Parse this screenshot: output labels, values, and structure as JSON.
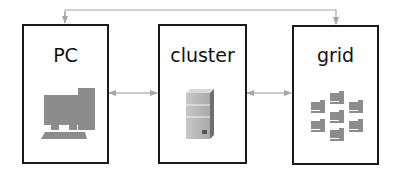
{
  "diagram": {
    "nodes": [
      {
        "id": "pc",
        "label": "PC",
        "icon": "desktop-computer-icon"
      },
      {
        "id": "cluster",
        "label": "cluster",
        "icon": "server-tower-icon"
      },
      {
        "id": "grid",
        "label": "grid",
        "icon": "networked-computers-icon"
      }
    ],
    "edges": [
      {
        "from": "pc",
        "to": "cluster",
        "type": "bidirectional"
      },
      {
        "from": "cluster",
        "to": "grid",
        "type": "bidirectional"
      },
      {
        "from": "pc",
        "to": "grid",
        "type": "bidirectional",
        "route": "over-top"
      }
    ],
    "colors": {
      "border": "#1a1a1a",
      "arrow": "#a6a6a6",
      "icon": "#8c8c8c"
    }
  }
}
